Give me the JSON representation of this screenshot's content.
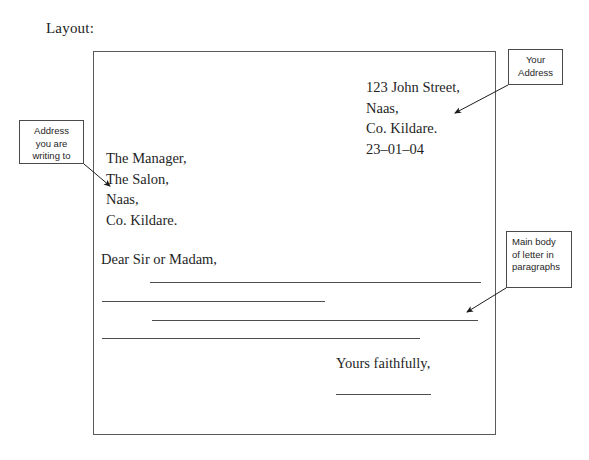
{
  "heading": {
    "label": "Layout:"
  },
  "letter": {
    "sender_address": [
      "123 John Street,",
      "Naas,",
      "Co. Kildare.",
      "23–01–04"
    ],
    "recipient_address": [
      "The Manager,",
      "The Salon,",
      "Naas,",
      "Co. Kildare."
    ],
    "salutation": "Dear Sir or Madam,",
    "closing": "Yours faithfully,",
    "body_rules": [
      {
        "x": 150,
        "y": 282,
        "width": 331
      },
      {
        "x": 102,
        "y": 301,
        "width": 223
      },
      {
        "x": 152,
        "y": 320,
        "width": 326
      },
      {
        "x": 102,
        "y": 338,
        "width": 318
      }
    ],
    "signature_rule": {
      "x": 336,
      "y": 394,
      "width": 95
    }
  },
  "callouts": [
    {
      "id": "your-address",
      "lines": [
        "Your",
        "Address"
      ],
      "align": "center"
    },
    {
      "id": "writing-to",
      "lines": [
        "Address",
        "you are",
        "writing to"
      ],
      "align": "center"
    },
    {
      "id": "main-body",
      "lines": [
        "Main body",
        "of letter in",
        "paragraphs"
      ],
      "align": "left"
    }
  ],
  "arrows": [
    {
      "name": "arrow-your-address",
      "x1": 508,
      "y1": 85,
      "x2": 455,
      "y2": 113
    },
    {
      "name": "arrow-writing-to",
      "x1": 84,
      "y1": 164,
      "x2": 110,
      "y2": 186
    },
    {
      "name": "arrow-main-body",
      "x1": 506,
      "y1": 288,
      "x2": 467,
      "y2": 312
    }
  ],
  "colors": {
    "frame_border": "#5a5a5a",
    "rule": "#4e4e4e",
    "callout_border": "#4a4a4a",
    "text": "#1f1f1f",
    "background": "#ffffff"
  }
}
